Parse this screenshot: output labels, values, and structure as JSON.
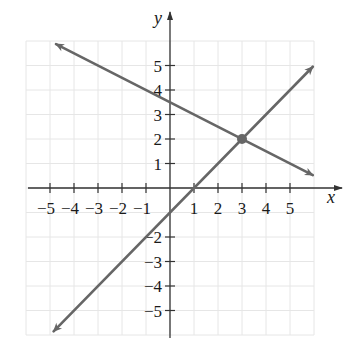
{
  "chart_data": {
    "type": "line",
    "title": "",
    "xlabel": "x",
    "ylabel": "y",
    "xlim": [
      -6,
      6
    ],
    "ylim": [
      -6,
      6
    ],
    "grid": true,
    "legend": null,
    "x_ticks": [
      -5,
      -4,
      -3,
      -2,
      -1,
      1,
      2,
      3,
      4,
      5
    ],
    "x_tick_labels": [
      "−5",
      "−4",
      "−3",
      "−2",
      "−1",
      "1",
      "2",
      "3",
      "4",
      "5"
    ],
    "y_ticks": [
      5,
      4,
      3,
      2,
      1,
      -2,
      -3,
      -4,
      -5
    ],
    "y_tick_labels": [
      "5",
      "4",
      "3",
      "2",
      "1",
      "−2",
      "−3",
      "−4",
      "−5"
    ],
    "series": [
      {
        "name": "line-increasing",
        "equation": "y = x - 1",
        "slope": 1,
        "intercept": -1,
        "x_start": -4.85,
        "x_end": 5.95,
        "arrows": "both",
        "color": "#666666"
      },
      {
        "name": "line-decreasing",
        "equation": "y = -0.5x + 3.5",
        "slope": -0.5,
        "intercept": 3.5,
        "x_start": -4.75,
        "x_end": 5.95,
        "arrows": "both",
        "color": "#666666"
      }
    ],
    "annotations": [
      {
        "type": "point",
        "x": 3,
        "y": 2,
        "label": "intersection",
        "color": "#666666"
      }
    ]
  },
  "colors": {
    "axis": "#333333",
    "grid": "#e6e6e6",
    "line": "#666666",
    "background": "#ffffff"
  }
}
